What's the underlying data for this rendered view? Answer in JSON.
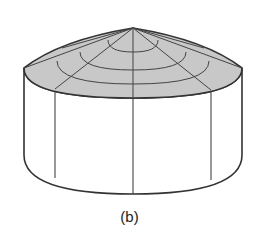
{
  "figure": {
    "caption": "(b)",
    "colors": {
      "background": "#ffffff",
      "stroke": "#333333",
      "roof_fill": "#c8c8c8"
    }
  }
}
